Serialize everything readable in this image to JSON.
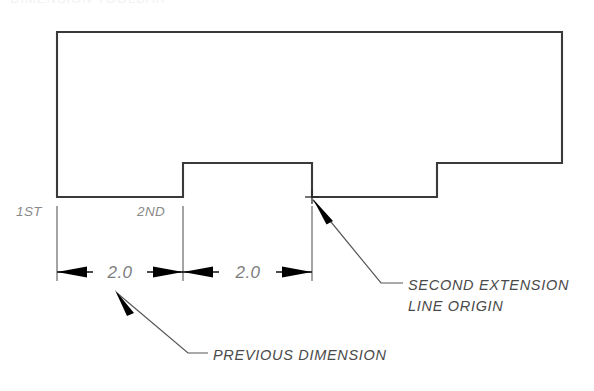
{
  "drawing": {
    "title_clipped": "DIMENSION TOOLBAR",
    "geometry": {
      "name": "stepped-block-profile",
      "description": "Rectangular block with two rectangular notches cut from lower edge",
      "outline_points": "57,197 57,32 562,32 562,163 437,163 437,197 312,197 312,163 183,163 183,197 57,197",
      "vertices": [
        {
          "label": "bottom-left",
          "x": 57,
          "y": 197
        },
        {
          "label": "top-left",
          "x": 57,
          "y": 32
        },
        {
          "label": "top-right",
          "x": 562,
          "y": 32
        },
        {
          "label": "right-lower",
          "x": 562,
          "y": 163
        },
        {
          "label": "step2-top-right",
          "x": 437,
          "y": 163
        },
        {
          "label": "step2-bottom-right",
          "x": 437,
          "y": 197
        },
        {
          "label": "notch-bottom-right",
          "x": 312,
          "y": 197
        },
        {
          "label": "notch-top-right",
          "x": 312,
          "y": 163
        },
        {
          "label": "notch-top-left",
          "x": 183,
          "y": 163
        },
        {
          "label": "notch-bottom-left",
          "x": 183,
          "y": 197
        }
      ]
    },
    "extension_lines": [
      {
        "name": "first-extension-line",
        "x": 57,
        "y_start": 206,
        "y_end": 281
      },
      {
        "name": "second-extension-line",
        "x": 183,
        "y_start": 206,
        "y_end": 281
      },
      {
        "name": "third-extension-line",
        "x": 312,
        "y_start": 206,
        "y_end": 281
      }
    ],
    "dimension_line": {
      "y": 272,
      "x_start": 57,
      "x_end": 312,
      "segments": [
        {
          "name": "dimension-segment-left",
          "value": "2.0",
          "x_start": 57,
          "x_end": 183
        },
        {
          "name": "dimension-segment-right",
          "value": "2.0",
          "x_start": 183,
          "x_end": 312
        }
      ]
    },
    "order_labels": [
      {
        "name": "first-origin-label",
        "text": "1ST",
        "x": 16,
        "y": 215
      },
      {
        "name": "second-origin-label",
        "text": "2ND",
        "x": 137,
        "y": 215
      }
    ],
    "origin_marker": {
      "name": "second-extension-line-origin-mark",
      "x": 312,
      "y": 197,
      "arm": 7
    },
    "annotations": [
      {
        "name": "second-extension-line-origin-note",
        "lines": [
          "SECOND  EXTENSION",
          "LINE  ORIGIN"
        ],
        "text_x": 408,
        "text_y_first": 290,
        "text_y_second": 311,
        "leader": "313,200 381,283 403,283",
        "arrow_tip": {
          "x": 312,
          "y": 197
        }
      },
      {
        "name": "previous-dimension-note",
        "lines": [
          "PREVIOUS  DIMENSION"
        ],
        "text_x": 213,
        "text_y_first": 360,
        "leader": "117,293 188,353 208,353",
        "arrow_tip": {
          "x": 115,
          "y": 290
        }
      }
    ],
    "colors": {
      "outline": "#3a3a3a",
      "extension_line": "#6e6e6e",
      "dimension_line": "#111111",
      "arrow_fill": "#000000",
      "dimension_text": "#7d7d7d",
      "order_label_text": "#8a8a8a",
      "note_text": "#4a4a4a",
      "background": "#ffffff"
    }
  }
}
